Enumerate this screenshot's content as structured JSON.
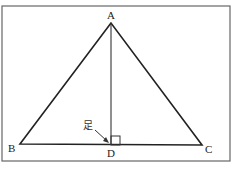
{
  "diagram": {
    "type": "triangle-altitude",
    "vertices": {
      "A": {
        "label": "A",
        "x": 111,
        "y": 23
      },
      "B": {
        "label": "B",
        "x": 20,
        "y": 144
      },
      "C": {
        "label": "C",
        "x": 202,
        "y": 145
      },
      "D": {
        "label": "D",
        "x": 111,
        "y": 145
      }
    },
    "foot_label": "足",
    "colors": {
      "line": "#222222",
      "frame": "#666666",
      "background": "#ffffff"
    }
  }
}
